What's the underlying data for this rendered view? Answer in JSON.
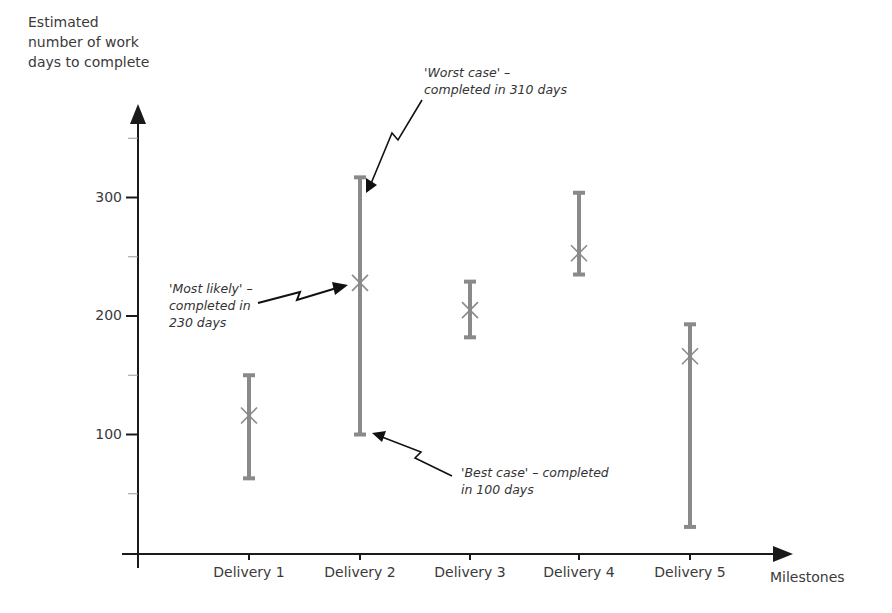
{
  "chart_data": {
    "type": "error_bar",
    "title": "",
    "ylabel_lines": [
      "Estimated",
      "number of work",
      "days to complete"
    ],
    "xlabel": "Milestones",
    "categories": [
      "Delivery 1",
      "Delivery 2",
      "Delivery 3",
      "Delivery 4",
      "Delivery 5"
    ],
    "series": [
      {
        "name": "Best case (min)",
        "values": [
          63,
          100,
          182,
          235,
          22
        ]
      },
      {
        "name": "Most likely",
        "values": [
          116,
          228,
          205,
          253,
          166
        ]
      },
      {
        "name": "Worst case (max)",
        "values": [
          150,
          317,
          229,
          304,
          193
        ]
      }
    ],
    "yticks": [
      100,
      200,
      300
    ],
    "yminor_ticks": [
      50,
      150,
      250,
      350
    ],
    "ylim": [
      0,
      380
    ],
    "grid": false,
    "legend": null,
    "annotations": [
      {
        "lines": [
          "'Worst case' –",
          "completed in 310 days"
        ],
        "target": "Delivery 2 max"
      },
      {
        "lines": [
          "'Most likely' –",
          "completed in",
          "230 days"
        ],
        "target": "Delivery 2 most likely"
      },
      {
        "lines": [
          "'Best case' – completed",
          "in 100 days"
        ],
        "target": "Delivery 2 min"
      }
    ],
    "colors": {
      "bar": "#8a8a8a",
      "axis": "#1a1a1a",
      "marker": "#8a8a8a"
    }
  }
}
